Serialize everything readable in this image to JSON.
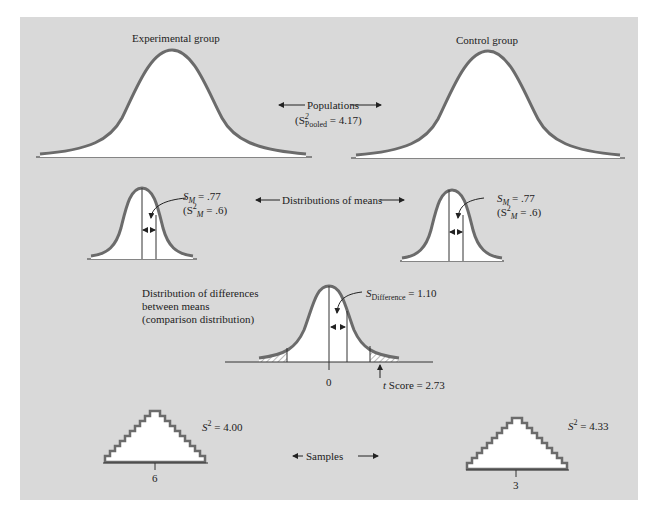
{
  "figure": {
    "populations": {
      "left_label": "Experimental group",
      "right_label": "Control group",
      "center_label": "Populations",
      "pooled_prefix": "(S",
      "pooled_sup": "2",
      "pooled_sub": "Pooled",
      "pooled_suffix": " = 4.17)"
    },
    "distributions_of_means": {
      "center_label": "Distributions of means",
      "left": {
        "sm_sym": "S",
        "sm_sub": "M",
        "sm_val": " = .77",
        "var_prefix": "(S",
        "var_sup": "2",
        "var_sub": "M",
        "var_val": " = .6)"
      },
      "right": {
        "sm_sym": "S",
        "sm_sub": "M",
        "sm_val": " = .77",
        "var_prefix": "(S",
        "var_sup": "2",
        "var_sub": "M",
        "var_val": " = .6)"
      }
    },
    "comparison": {
      "label_line1": "Distribution of differences",
      "label_line2": "between means",
      "label_line3": "(comparison distribution)",
      "sdiff_sym": "S",
      "sdiff_sub": "Difference",
      "sdiff_val": " = 1.10",
      "zero_tick": "0",
      "t_italic": "t",
      "t_label": " Score = 2.73"
    },
    "samples": {
      "center_label": "Samples",
      "left": {
        "var_sym": "S",
        "var_sup": "2",
        "var_val": " = 4.00",
        "mean_tick": "6"
      },
      "right": {
        "var_sym": "S",
        "var_sup": "2",
        "var_val": " = 4.33",
        "mean_tick": "3"
      }
    },
    "colors": {
      "panel_bg": "#d9d9d9",
      "curve_stroke": "#6b6b6b",
      "fill": "#ffffff",
      "line": "#333333"
    }
  }
}
